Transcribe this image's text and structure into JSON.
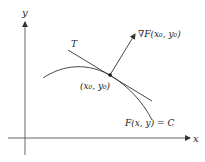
{
  "diagram": {
    "axes": {
      "x_label": "x",
      "y_label": "y"
    },
    "tangent_label": "T",
    "gradient_label": "∇F(x₀, y₀)",
    "point_label": "(x₀, y₀)",
    "curve_label": "F(x, y) = C",
    "colors": {
      "line": "#333333",
      "axis": "#555555",
      "background": "#ffffff"
    }
  }
}
